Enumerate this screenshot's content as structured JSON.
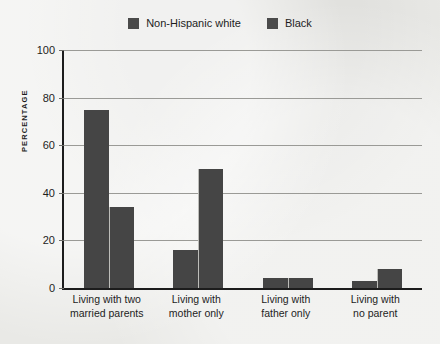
{
  "chart_data": {
    "type": "bar",
    "title": "",
    "subtitle": "",
    "xlabel": "",
    "ylabel": "PERCENTAGE",
    "ylim": [
      0,
      100
    ],
    "yticks": [
      0,
      20,
      40,
      60,
      80,
      100
    ],
    "grid": true,
    "legend_position": "top-center",
    "categories": [
      "Living with two married parents",
      "Living with mother only",
      "Living with father only",
      "Living with no parent"
    ],
    "category_lines": [
      [
        "Living with two",
        "married parents"
      ],
      [
        "Living with",
        "mother only"
      ],
      [
        "Living with",
        "father only"
      ],
      [
        "Living with",
        "no parent"
      ]
    ],
    "series": [
      {
        "name": "Non-Hispanic white",
        "color": "#454545",
        "values": [
          75,
          16,
          4,
          3
        ]
      },
      {
        "name": "Black",
        "color": "#454545",
        "values": [
          34,
          50,
          4,
          8
        ]
      }
    ]
  },
  "colors": {
    "background": "#e9e9e6",
    "bar": "#454545",
    "axis": "#1c1c1c",
    "gridline": "#9a9a96",
    "text": "#1d1d1d"
  }
}
